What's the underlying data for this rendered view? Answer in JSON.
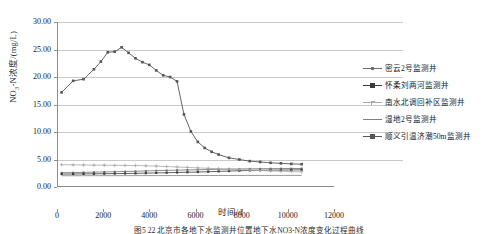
{
  "chart_data": {
    "type": "line",
    "title": "",
    "xlabel": "时间/d",
    "ylabel": "NO3-N浓度/(mg/L)",
    "ylabel_parts": {
      "pre": "NO",
      "sub": "3",
      "post": "-N浓度/(mg/L)"
    },
    "xlim": [
      0,
      12000
    ],
    "ylim": [
      0,
      30
    ],
    "xticks": [
      0,
      2000,
      4000,
      6000,
      8000,
      10000,
      12000
    ],
    "xtick_labels": [
      "0",
      "2000",
      "4000",
      "6000",
      "8000",
      "10000",
      "12000"
    ],
    "yticks": [
      0,
      5,
      10,
      15,
      20,
      25,
      30
    ],
    "ytick_labels": [
      "0.00",
      "5.00",
      "10.00",
      "15.00",
      "20.00",
      "25.00",
      "30.00"
    ],
    "grid": "horizontal",
    "legend_position": "right",
    "series": [
      {
        "name": "密云2号监测井",
        "color": "#6e6e6e",
        "marker": "square-small",
        "x": [
          200,
          700,
          1150,
          1600,
          2050,
          2500,
          2950,
          3400,
          3850,
          4300,
          4750,
          5200,
          5650,
          6100,
          6550,
          7000,
          7450,
          7900,
          8350,
          8800,
          9250,
          9700,
          10150,
          10600
        ],
        "values": [
          2.6,
          2.62,
          2.66,
          2.7,
          2.74,
          2.78,
          2.82,
          2.86,
          2.92,
          2.98,
          3.02,
          3.06,
          3.1,
          3.14,
          3.18,
          3.22,
          3.26,
          3.28,
          3.3,
          3.32,
          3.34,
          3.35,
          3.36,
          3.37
        ]
      },
      {
        "name": "怀柔刘两河监测井",
        "color": "#3a3a3a",
        "marker": "square",
        "x": [
          200,
          700,
          1150,
          1600,
          2050,
          2500,
          2950,
          3400,
          3850,
          4300,
          4750,
          5200,
          5650,
          6100,
          6550,
          7000,
          7450,
          7900,
          8350,
          8800,
          9250,
          9700,
          10150,
          10600
        ],
        "values": [
          2.35,
          2.36,
          2.38,
          2.4,
          2.42,
          2.44,
          2.46,
          2.48,
          2.52,
          2.56,
          2.6,
          2.64,
          2.68,
          2.72,
          2.78,
          2.84,
          2.9,
          2.96,
          3.0,
          3.04,
          3.06,
          3.08,
          3.1,
          3.12
        ]
      },
      {
        "name": "南水北调回补区监测井",
        "color": "#a8a8a8",
        "marker": "plus",
        "x": [
          200,
          700,
          1150,
          1600,
          2050,
          2500,
          2950,
          3400,
          3850,
          4300,
          4750,
          5200,
          5650,
          6100,
          6550,
          7000,
          7450,
          7900,
          8350,
          8800,
          9250,
          9700,
          10150,
          10600
        ],
        "values": [
          4.05,
          4.02,
          4.0,
          3.98,
          3.96,
          3.94,
          3.92,
          3.9,
          3.86,
          3.8,
          3.72,
          3.64,
          3.56,
          3.48,
          3.4,
          3.32,
          3.24,
          3.16,
          3.08,
          3.0,
          2.92,
          2.86,
          2.8,
          2.76
        ]
      },
      {
        "name": "湿地2号监测井",
        "color": "#808080",
        "marker": "none",
        "x": [
          200,
          1000,
          1800,
          2600,
          3400,
          4200,
          5000,
          5800,
          6600,
          7400,
          8200,
          9000,
          9800,
          10600
        ],
        "values": [
          2.05,
          2.05,
          2.06,
          2.06,
          2.07,
          2.07,
          2.08,
          2.08,
          2.09,
          2.09,
          2.1,
          2.1,
          2.11,
          2.11
        ]
      },
      {
        "name": "顺义引温济潮50m监测井",
        "color": "#555555",
        "marker": "square-big",
        "x": [
          200,
          700,
          1150,
          1600,
          1900,
          2200,
          2500,
          2800,
          3100,
          3400,
          3700,
          4000,
          4300,
          4600,
          4900,
          5200,
          5500,
          5800,
          6100,
          6400,
          6700,
          7000,
          7450,
          7900,
          8350,
          8800,
          9250,
          9700,
          10150,
          10600
        ],
        "values": [
          17.2,
          19.3,
          19.6,
          21.4,
          22.8,
          24.5,
          24.6,
          25.4,
          24.4,
          23.4,
          22.7,
          22.2,
          21.2,
          20.3,
          20.0,
          19.2,
          13.2,
          10.1,
          8.2,
          7.1,
          6.4,
          5.9,
          5.3,
          5.0,
          4.7,
          4.55,
          4.4,
          4.3,
          4.2,
          4.15
        ]
      }
    ]
  },
  "caption": {
    "text": "图5  22  北京市各地下水监测井位置地下水NO3-N浓度变化过程曲线"
  }
}
